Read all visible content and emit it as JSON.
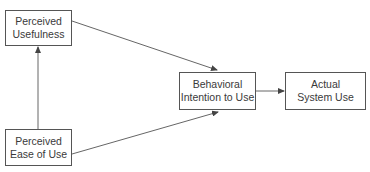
{
  "diagram": {
    "nodes": {
      "perceived_usefulness": {
        "line1": "Perceived",
        "line2": "Usefulness"
      },
      "perceived_ease_of_use": {
        "line1": "Perceived",
        "line2": "Ease of Use"
      },
      "behavioral_intention": {
        "line1": "Behavioral",
        "line2": "Intention to Use"
      },
      "actual_system_use": {
        "line1": "Actual",
        "line2": "System Use"
      }
    },
    "edges": [
      {
        "from": "Perceived Ease of Use",
        "to": "Perceived Usefulness"
      },
      {
        "from": "Perceived Usefulness",
        "to": "Behavioral Intention to Use"
      },
      {
        "from": "Perceived Ease of Use",
        "to": "Behavioral Intention to Use"
      },
      {
        "from": "Behavioral Intention to Use",
        "to": "Actual System Use"
      }
    ],
    "colors": {
      "line": "#555555",
      "text": "#3a3a3a"
    }
  }
}
